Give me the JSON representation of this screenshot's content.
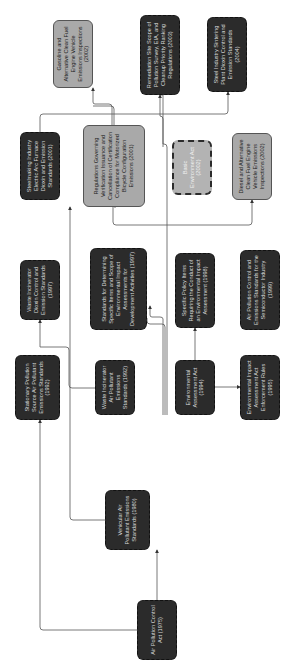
{
  "diagram": {
    "title": "",
    "orientation": "rotated -90deg (reads bottom-to-top)",
    "colors": {
      "dark_node_fill": "#2b2b2b",
      "light_node_fill": "#a9a9a9",
      "connector": "#555555",
      "background": "#ffffff"
    },
    "nodes": [
      {
        "id": "n1975",
        "label": "Air Pollution Control Act (1975)",
        "style": "dark"
      },
      {
        "id": "n1980",
        "label": "Vehicular Air Pollutant Emissions Standards (1980)",
        "style": "dark"
      },
      {
        "id": "n1992a",
        "label": "Stationary Pollution Source Air Pollutant Emissions Standards (1992)",
        "style": "dark"
      },
      {
        "id": "n1992b",
        "label": "Waste Incinerator Air Pollutant Emissions Standards (1992)",
        "style": "dark"
      },
      {
        "id": "n1994",
        "label": "Environmental Assessment Act (1994)",
        "style": "dark"
      },
      {
        "id": "n1995",
        "label": "Environmental Impact Assessment Act Enforcement Rules (1995)",
        "style": "dark"
      },
      {
        "id": "n1997a",
        "label": "Waste Incinerator Dioxin Control and Emission Standards (1997)",
        "style": "dark"
      },
      {
        "id": "n1997b",
        "label": "Standards for Determining Specific Items and Scope of Environmental Impact Assessments for Development Activities (1997)",
        "style": "dark"
      },
      {
        "id": "n1998",
        "label": "Specific Policy Items Requiring the Conduct of an Environmental Impact Assessment (1998)",
        "style": "dark"
      },
      {
        "id": "n1999",
        "label": "Air Pollution Control and Emissions Standards for the Semiconductor Industry (1999)",
        "style": "dark"
      },
      {
        "id": "n2001a",
        "label": "Steelmaking Industry Electric Arc Furnace Dioxin and Emission Standards (2001)",
        "style": "dark"
      },
      {
        "id": "n2001b",
        "label": "Regulations Governing Verification Issuance and Cancellation of Certification Compliance for Motorized Bicycle Configuration Emissions (2001)",
        "style": "light"
      },
      {
        "id": "n2002a",
        "label": "Basic Environment Act (2002)",
        "style": "light-dash"
      },
      {
        "id": "n2002b",
        "label": "Diesel and Alternative Clean Fuel Engine Vehicle Emissions Inspections (2002)",
        "style": "light"
      },
      {
        "id": "n2002c",
        "label": "Gasoline and Alternative Clean Fuel Engine Vehicle Emissions Inspections (2002)",
        "style": "light"
      },
      {
        "id": "n2003",
        "label": "Remediation Site Scope of Pollution Survey, EIA, and Cleanup Priority Ranking Regulations (2003)",
        "style": "dark"
      },
      {
        "id": "n2004",
        "label": "Steel Industry Sintering Plant Dioxin Control and Emission Standards (2004)",
        "style": "dark"
      }
    ],
    "edges": [
      {
        "from": "n1975",
        "to": "n1980"
      },
      {
        "from": "n1975",
        "to": "n1992a"
      },
      {
        "from": "n1980",
        "to": "n2001b"
      },
      {
        "from": "n1992b",
        "to": "n1997a"
      },
      {
        "from": "n1994",
        "to": "n1995"
      },
      {
        "from": "n1994",
        "to": "n1997b"
      },
      {
        "from": "n1994",
        "to": "n1998"
      },
      {
        "from": "n1994",
        "to": "n2003"
      },
      {
        "from": "n2001a",
        "to": "n2004"
      },
      {
        "from": "n2001b",
        "to": "n2002b"
      },
      {
        "from": "n2001b",
        "to": "n2002c"
      }
    ]
  }
}
